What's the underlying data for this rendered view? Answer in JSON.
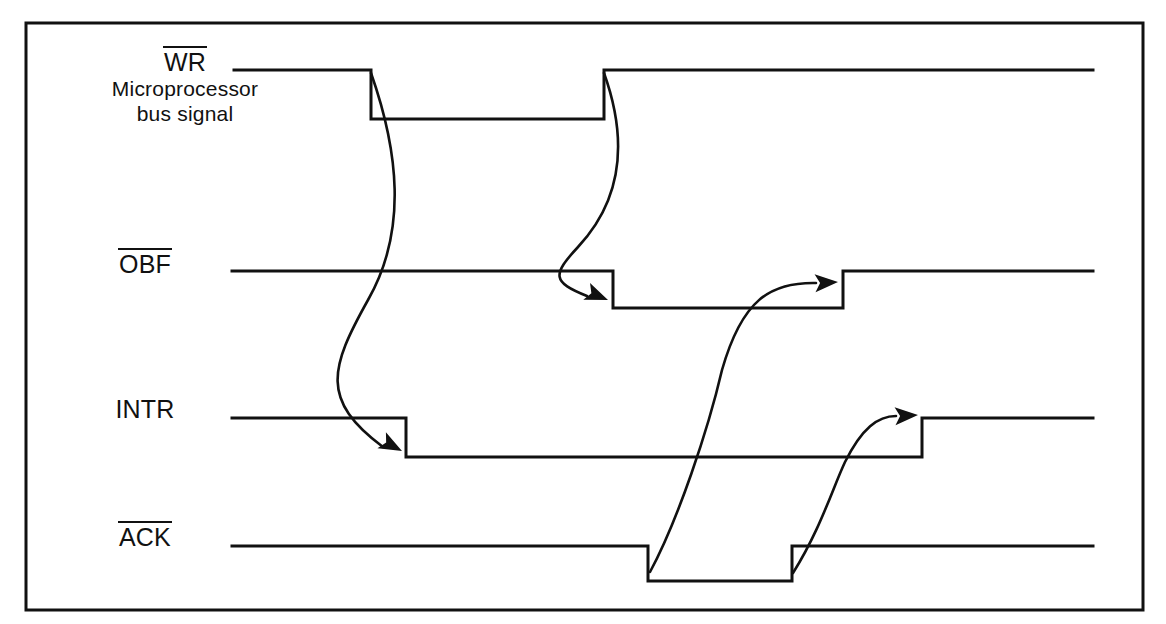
{
  "figure": {
    "background_color": "#ffffff",
    "line_color": "#111111",
    "border": {
      "x": 26,
      "y": 23,
      "width": 1117,
      "height": 587,
      "thickness": 3
    }
  },
  "signals": [
    {
      "id": "wr",
      "name": "WR",
      "overline": true,
      "sublabel_line1": "Microprocessor",
      "sublabel_line2": "bus signal",
      "active_low": true,
      "high_y": 70,
      "low_y": 119,
      "start_x": 234,
      "end_x": 1093,
      "edges": [
        {
          "type": "falling",
          "x": 371
        },
        {
          "type": "rising",
          "x": 604
        }
      ]
    },
    {
      "id": "obf",
      "name": "OBF",
      "overline": true,
      "sublabel_line1": "",
      "sublabel_line2": "",
      "active_low": true,
      "high_y": 271,
      "low_y": 308,
      "start_x": 232,
      "end_x": 1093,
      "edges": [
        {
          "type": "falling",
          "x": 613
        },
        {
          "type": "rising",
          "x": 843
        }
      ]
    },
    {
      "id": "intr",
      "name": "INTR",
      "overline": false,
      "sublabel_line1": "",
      "sublabel_line2": "",
      "active_low": false,
      "high_y": 418,
      "low_y": 457,
      "start_x": 232,
      "end_x": 1093,
      "edges": [
        {
          "type": "falling",
          "x": 406
        },
        {
          "type": "rising",
          "x": 922
        }
      ]
    },
    {
      "id": "ack",
      "name": "ACK",
      "overline": true,
      "sublabel_line1": "",
      "sublabel_line2": "",
      "active_low": true,
      "high_y": 546,
      "low_y": 581,
      "start_x": 232,
      "end_x": 1093,
      "edges": [
        {
          "type": "falling",
          "x": 648
        },
        {
          "type": "rising",
          "x": 792
        }
      ]
    }
  ],
  "causality_arrows": [
    {
      "id": "wr-fall-to-intr-fall",
      "from_signal": "wr",
      "from_edge": "falling",
      "to_signal": "intr",
      "to_edge": "falling",
      "path": "M 371,73 C 398,150 408,230 368,300 C 330,368 320,400 383,447",
      "arrow_tip": {
        "x": 402,
        "y": 451
      },
      "arrow_angle": 28
    },
    {
      "id": "wr-rise-to-obf-fall",
      "from_signal": "wr",
      "from_edge": "rising",
      "to_signal": "obf",
      "to_edge": "falling",
      "path": "M 604,73 C 628,140 622,200 578,247 C 552,275 552,282 587,296",
      "arrow_tip": {
        "x": 608,
        "y": 300
      },
      "arrow_angle": 22
    },
    {
      "id": "ack-fall-to-obf-rise",
      "from_signal": "ack",
      "from_edge": "falling",
      "to_signal": "obf",
      "to_edge": "rising",
      "path": "M 650,572 C 678,520 708,430 722,370 C 742,300 770,282 816,283",
      "arrow_tip": {
        "x": 838,
        "y": 282
      },
      "arrow_angle": -3
    },
    {
      "id": "ack-rise-to-intr-rise",
      "from_signal": "ack",
      "from_edge": "rising",
      "to_signal": "intr",
      "to_edge": "rising",
      "path": "M 793,573 C 820,530 832,490 845,462 C 862,428 878,416 896,416",
      "arrow_tip": {
        "x": 918,
        "y": 415
      },
      "arrow_angle": -3
    }
  ]
}
